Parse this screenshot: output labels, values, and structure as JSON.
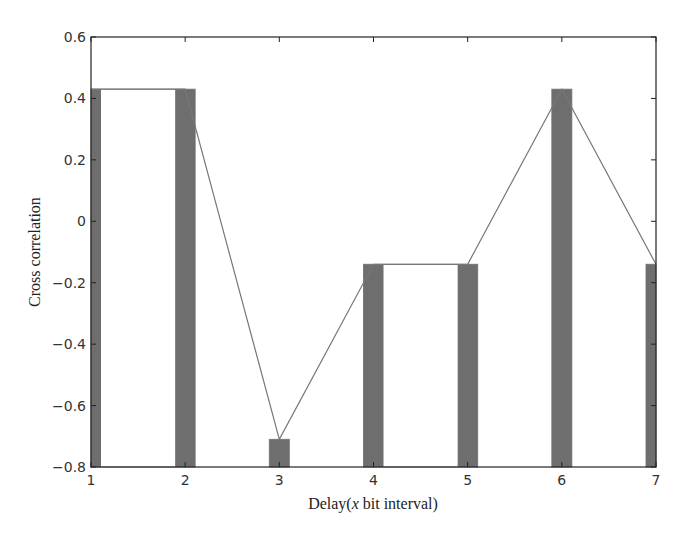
{
  "chart_data": {
    "type": "bar",
    "title": "",
    "xlabel": "Delay(x bit interval)",
    "xlabel_parts": {
      "prefix": "Delay(",
      "italic": "x",
      "suffix": " bit interval)"
    },
    "ylabel": "Cross correlation",
    "x": [
      1,
      2,
      3,
      4,
      5,
      6,
      7
    ],
    "xticks": [
      "1",
      "2",
      "3",
      "4",
      "5",
      "6",
      "7"
    ],
    "yticks": [
      "0.6",
      "0.4",
      "0.2",
      "0",
      "−0.2",
      "−0.4",
      "−0.6",
      "−0.8"
    ],
    "ytick_values": [
      0.6,
      0.4,
      0.2,
      0,
      -0.2,
      -0.4,
      -0.6,
      -0.8
    ],
    "xlim": [
      1,
      7
    ],
    "ylim": [
      -0.8,
      0.6
    ],
    "grid": false,
    "legend": null,
    "series": [
      {
        "name": "bars",
        "style": "filled dark gray bars",
        "values": [
          0.43,
          0.43,
          -0.71,
          -0.14,
          -0.14,
          0.43,
          -0.14
        ]
      },
      {
        "name": "stairs",
        "style": "thin outline step",
        "values": [
          0.43,
          0.43,
          -0.71,
          -0.14,
          -0.14,
          0.43,
          -0.14
        ]
      },
      {
        "name": "line",
        "style": "thin gray line",
        "values": [
          0.43,
          0.43,
          -0.71,
          -0.14,
          -0.14,
          0.43,
          -0.14
        ]
      }
    ],
    "colors": {
      "bar": "#6e6e6e",
      "line": "#777777",
      "axis": "#222222"
    }
  }
}
